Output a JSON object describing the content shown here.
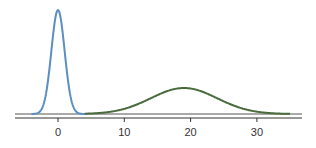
{
  "chart_data": {
    "type": "line",
    "title": "",
    "xlabel": "",
    "ylabel": "",
    "xlim": [
      -6.5,
      37
    ],
    "x_ticks": [
      0,
      10,
      20,
      30
    ],
    "x_tick_labels": [
      "0",
      "10",
      "20",
      "30"
    ],
    "grid": false,
    "legend": null,
    "series": [
      {
        "name": "blue density",
        "color": "#5b8fc2",
        "distribution": "normal",
        "mean": 0,
        "sd": 1,
        "x_range": [
          -4,
          4
        ],
        "peak_height_px": 104
      },
      {
        "name": "green density",
        "color": "#4a6b3e",
        "distribution": "normal",
        "mean": 19,
        "sd": 5,
        "x_range": [
          4,
          35
        ],
        "peak_height_px": 26
      }
    ]
  },
  "axis": {
    "ticks": [
      {
        "value": 0,
        "label": "0"
      },
      {
        "value": 10,
        "label": "10"
      },
      {
        "value": 20,
        "label": "20"
      },
      {
        "value": 30,
        "label": "30"
      }
    ]
  }
}
